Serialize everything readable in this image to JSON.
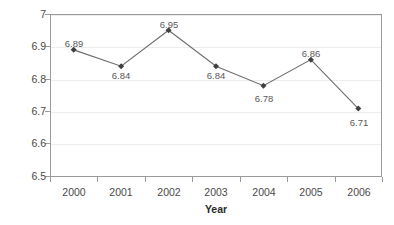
{
  "chart_data": {
    "type": "line",
    "title": "",
    "xlabel": "Year",
    "ylabel": "Rate per 1,000 live births",
    "categories": [
      "2000",
      "2001",
      "2002",
      "2003",
      "2004",
      "2005",
      "2006"
    ],
    "values": [
      6.89,
      6.84,
      6.95,
      6.84,
      6.78,
      6.86,
      6.71
    ],
    "point_labels": [
      "6.89",
      "6.84",
      "6.95",
      "6.84",
      "6.78",
      "6.86",
      "6.71"
    ],
    "label_positions": [
      "above",
      "below",
      "above",
      "below",
      "below",
      "above",
      "below"
    ],
    "ylim": [
      6.5,
      7.0
    ],
    "yticks": [
      6.5,
      6.6,
      6.7,
      6.8,
      6.9,
      7.0
    ],
    "ytick_labels": [
      "6.5",
      "6.6",
      "6.7",
      "6.8",
      "6.9",
      "7"
    ],
    "grid": "horizontal",
    "legend": "none",
    "marker": "diamond",
    "series_color": "#3f3f3f",
    "line_color": "#6b6b6b",
    "gridline_color": "#ededed",
    "frame_color": "#9a9a9a"
  }
}
